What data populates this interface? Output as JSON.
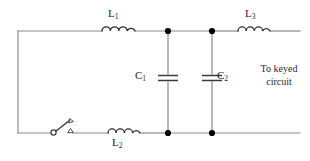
{
  "diagram": {
    "type": "electrical-schematic",
    "background_color": "#ffffff",
    "wire_color": "#8a8a8a",
    "component_color": "#2e2e2e",
    "node_color": "#000000"
  },
  "labels": {
    "l1": "L",
    "l1_sub": "1",
    "l2": "L",
    "l2_sub": "2",
    "l3": "L",
    "l3_sub": "3",
    "c1": "C",
    "c1_sub": "1",
    "c2": "C",
    "c2_sub": "2",
    "keyed_note": "To keyed\ncircuit"
  },
  "components": [
    {
      "name": "L1",
      "kind": "inductor",
      "label": "L1",
      "position": "top-branch-left"
    },
    {
      "name": "L2",
      "kind": "inductor",
      "label": "L2",
      "position": "bottom-branch-left"
    },
    {
      "name": "L3",
      "kind": "inductor",
      "label": "L3",
      "position": "top-branch-right"
    },
    {
      "name": "C1",
      "kind": "capacitor",
      "label": "C1",
      "position": "shunt-left"
    },
    {
      "name": "C2",
      "kind": "capacitor",
      "label": "C2",
      "position": "shunt-right"
    },
    {
      "name": "SW1",
      "kind": "switch",
      "label": "",
      "position": "bottom-branch-far-left"
    }
  ],
  "nodes": [
    {
      "name": "node-top-left",
      "x": 168,
      "y": 31
    },
    {
      "name": "node-top-right",
      "x": 212,
      "y": 31
    },
    {
      "name": "node-bottom-left",
      "x": 168,
      "y": 133
    },
    {
      "name": "node-bottom-right",
      "x": 212,
      "y": 133
    }
  ]
}
